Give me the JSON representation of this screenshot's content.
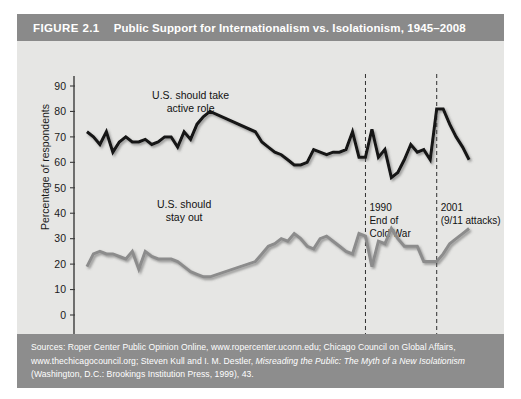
{
  "figure": {
    "number": "FIGURE 2.1",
    "title": "Public Support for Internationalism vs. Isolationism, 1945–2008",
    "sources_line1": "Sources: Roper Center Public Opinion Online, www.ropercenter.uconn.edu; Chicago Council on Global",
    "sources_line2a": "Affairs, www.thechicagocouncil.org; Steven Kull and I. M. Destler, ",
    "sources_line2b": "Misreading the Public: The Myth of a New",
    "sources_line3a": "Isolationism",
    "sources_line3b": " (Washington, D.C.: Brookings Institution Press, 1999), 43."
  },
  "colors": {
    "header_bar": "#8a8a8a",
    "footer_bar": "#8d8d8d",
    "plot_background": "#e6e6e4",
    "active_role_line": "#121212",
    "stay_out_line": "#8c8c8c",
    "axis": "#3b3b3b"
  },
  "chart_data": {
    "type": "line",
    "title": "Public Support for Internationalism vs. Isolationism, 1945–2008",
    "xlabel": "",
    "ylabel": "Percentage of respondents",
    "xlim": [
      1945,
      2010
    ],
    "ylim": [
      0,
      90
    ],
    "ytick_labels": [
      "0",
      "10",
      "20",
      "30",
      "40",
      "50",
      "60",
      "70",
      "80",
      "90"
    ],
    "yticks": [
      0,
      10,
      20,
      30,
      40,
      50,
      60,
      70,
      80,
      90
    ],
    "xtick_labels": [
      "1945",
      "1950",
      "1955",
      "1960",
      "1965",
      "1970",
      "1975",
      "1980",
      "1985",
      "1990",
      "1995",
      "2000",
      "2005",
      "2010"
    ],
    "xticks": [
      1945,
      1950,
      1955,
      1960,
      1965,
      1970,
      1975,
      1980,
      1985,
      1990,
      1995,
      2000,
      2005,
      2010
    ],
    "minor_tick_interval": 1,
    "grid": false,
    "legend": "inline-labels",
    "series": [
      {
        "name": "U.S. should take active role",
        "color": "#121212",
        "x": [
          1947,
          1948,
          1949,
          1950,
          1951,
          1952,
          1953,
          1954,
          1955,
          1956,
          1957,
          1958,
          1959,
          1960,
          1961,
          1962,
          1963,
          1964,
          1965,
          1966,
          1973,
          1974,
          1975,
          1976,
          1977,
          1978,
          1979,
          1980,
          1981,
          1982,
          1983,
          1984,
          1985,
          1986,
          1987,
          1988,
          1989,
          1990,
          1991,
          1992,
          1993,
          1994,
          1995,
          1996,
          1997,
          1998,
          1999,
          2000,
          2001,
          2002,
          2003,
          2004,
          2005,
          2006
        ],
        "y": [
          72,
          70,
          67,
          72,
          64,
          68,
          70,
          68,
          68,
          69,
          67,
          68,
          70,
          70,
          66,
          72,
          69,
          75,
          78,
          80,
          72,
          68,
          66,
          64,
          63,
          61,
          59,
          59,
          60,
          65,
          64,
          63,
          64,
          64,
          65,
          72,
          62,
          62,
          73,
          62,
          65,
          54,
          56,
          61,
          67,
          64,
          65,
          61,
          81,
          81,
          75,
          70,
          66,
          61
        ]
      },
      {
        "name": "U.S. should stay out",
        "color": "#8c8c8c",
        "x": [
          1947,
          1948,
          1949,
          1950,
          1951,
          1952,
          1953,
          1954,
          1955,
          1956,
          1957,
          1958,
          1959,
          1960,
          1961,
          1962,
          1963,
          1964,
          1965,
          1966,
          1973,
          1974,
          1975,
          1976,
          1977,
          1978,
          1979,
          1980,
          1981,
          1982,
          1983,
          1984,
          1985,
          1986,
          1987,
          1988,
          1989,
          1990,
          1991,
          1992,
          1993,
          1994,
          1995,
          1996,
          1997,
          1998,
          1999,
          2000,
          2001,
          2002,
          2003,
          2004,
          2005,
          2006
        ],
        "y": [
          19,
          24,
          25,
          24,
          24,
          23,
          22,
          25,
          18,
          25,
          23,
          22,
          22,
          22,
          21,
          19,
          17,
          16,
          15,
          15,
          21,
          24,
          27,
          28,
          30,
          29,
          32,
          30,
          27,
          26,
          30,
          31,
          29,
          27,
          25,
          24,
          32,
          31,
          19,
          29,
          28,
          34,
          30,
          27,
          27,
          27,
          21,
          21,
          21,
          24,
          28,
          30,
          32,
          34
        ]
      }
    ],
    "annotations": [
      {
        "x": 1990,
        "line1": "1990",
        "line2": "End of",
        "line3": "Cold War",
        "style": "dashed-vertical"
      },
      {
        "x": 2001,
        "line1": "2001",
        "line2": "(9/11 attacks)",
        "line3": "",
        "style": "dashed-vertical"
      }
    ],
    "series_labels": [
      {
        "text_line1": "U.S. should take",
        "text_line2": "active role",
        "x": 1963,
        "y": 85
      },
      {
        "text_line1": "U.S. should",
        "text_line2": "stay out",
        "x": 1962,
        "y": 42
      }
    ]
  }
}
